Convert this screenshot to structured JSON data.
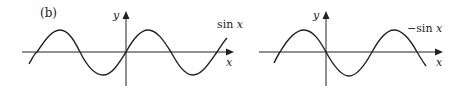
{
  "figure": {
    "panel_label": "(b)",
    "graphs": [
      {
        "id": "left",
        "function_label": "sin x",
        "x_axis_label": "x",
        "y_axis_label": "y"
      },
      {
        "id": "right",
        "function_label": "−sin x",
        "x_axis_label": "x",
        "y_axis_label": "y"
      }
    ]
  },
  "colors": {
    "ink": "#222222",
    "background": "#ffffff"
  }
}
